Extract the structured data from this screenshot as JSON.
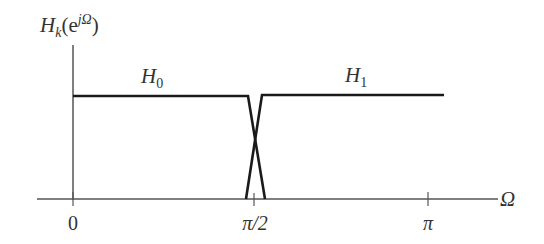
{
  "diagram": {
    "type": "filter-frequency-response",
    "y_axis_label": {
      "base": "H",
      "sub": "k",
      "paren_open": "(e",
      "sup": "jΩ",
      "paren_close": ")"
    },
    "x_axis_label": "Ω",
    "ticks": [
      {
        "label": "0",
        "x": 73
      },
      {
        "label": "π/2",
        "x": 254
      },
      {
        "label": "π",
        "x": 428
      }
    ],
    "curves": [
      {
        "name": "H",
        "sub": "0",
        "label_x": 150,
        "label_y": 83
      },
      {
        "name": "H",
        "sub": "1",
        "label_x": 353,
        "label_y": 82
      }
    ],
    "colors": {
      "line": "#1a1a1a",
      "axis": "#555555",
      "text": "#333333"
    }
  }
}
